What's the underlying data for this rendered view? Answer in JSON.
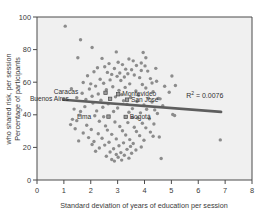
{
  "chart_data": {
    "type": "scatter",
    "title": "",
    "xlabel": "Standard deviation of years of education per session",
    "ylabel": "Percentage of participants who shared risk, per session",
    "xlim": [
      0,
      8
    ],
    "ylim": [
      0,
      100
    ],
    "xticks": [
      0,
      1,
      2,
      3,
      4,
      5,
      6,
      7,
      8
    ],
    "yticks": [
      0,
      20,
      40,
      60,
      80,
      100
    ],
    "grid": false,
    "legend": false,
    "annotations": [
      {
        "name": "r-squared",
        "text": "R2 = 0.0076",
        "prefix": "R",
        "sup": "2",
        "suffix": " = 0.0076",
        "x": 5.55,
        "y": 50.5
      }
    ],
    "trendline": {
      "name": "linear-fit",
      "color": "#5e5e5e",
      "x0": 0.98,
      "y0": 49.2,
      "x1": 6.85,
      "y1": 41.8,
      "width": 2.6
    },
    "marker": {
      "color": "#8c8c8c",
      "size": 1.7,
      "shape": "dot"
    },
    "highlight_marker": {
      "color": "#9a9a9a",
      "size": 3.4,
      "shape": "square",
      "edge": "#4a4a4a"
    },
    "labeled_points": [
      {
        "label": "Caracas",
        "x": 2.55,
        "y": 53.5,
        "label_dx": -30,
        "label_dy": 1.5
      },
      {
        "label": "Buenos Aires",
        "x": 2.72,
        "y": 49.8,
        "label_dx": -44,
        "label_dy": 2.0
      },
      {
        "label": "Montevideo",
        "x": 3.02,
        "y": 52.6,
        "label_dx": 4,
        "label_dy": 2.0
      },
      {
        "label": "San José",
        "x": 3.35,
        "y": 49.3,
        "label_dx": 4,
        "label_dy": 2.2
      },
      {
        "label": "Lima",
        "x": 2.66,
        "y": 38.9,
        "label_dx": -20,
        "label_dy": 2.0
      },
      {
        "label": "Bogotá",
        "x": 3.3,
        "y": 38.7,
        "label_dx": 4,
        "label_dy": 2.4
      }
    ],
    "points": [
      [
        1.05,
        94.4
      ],
      [
        1.62,
        86.0
      ],
      [
        2.05,
        81.3
      ],
      [
        2.95,
        78.6
      ],
      [
        3.95,
        78.2
      ],
      [
        1.52,
        75.0
      ],
      [
        2.42,
        74.6
      ],
      [
        3.42,
        74.2
      ],
      [
        3.58,
        73.1
      ],
      [
        3.02,
        72.2
      ],
      [
        2.68,
        71.4
      ],
      [
        3.18,
        70.8
      ],
      [
        3.7,
        70.2
      ],
      [
        4.02,
        70.0
      ],
      [
        2.52,
        69.5
      ],
      [
        2.25,
        68.9
      ],
      [
        2.88,
        68.4
      ],
      [
        3.3,
        68.0
      ],
      [
        3.52,
        67.6
      ],
      [
        3.88,
        67.2
      ],
      [
        4.12,
        66.8
      ],
      [
        2.12,
        66.4
      ],
      [
        2.62,
        66.0
      ],
      [
        3.08,
        65.6
      ],
      [
        3.38,
        65.2
      ],
      [
        2.78,
        64.8
      ],
      [
        3.62,
        64.4
      ],
      [
        1.88,
        64.0
      ],
      [
        2.98,
        63.6
      ],
      [
        3.25,
        63.2
      ],
      [
        3.82,
        62.8
      ],
      [
        4.22,
        62.2
      ],
      [
        2.35,
        61.8
      ],
      [
        2.72,
        61.4
      ],
      [
        3.12,
        61.0
      ],
      [
        4.45,
        60.6
      ],
      [
        1.72,
        59.8
      ],
      [
        2.48,
        59.4
      ],
      [
        3.45,
        59.0
      ],
      [
        3.92,
        58.6
      ],
      [
        5.15,
        58.0
      ],
      [
        2.18,
        57.6
      ],
      [
        2.82,
        57.2
      ],
      [
        3.28,
        56.8
      ],
      [
        4.05,
        56.4
      ],
      [
        1.95,
        55.8
      ],
      [
        2.58,
        55.4
      ],
      [
        3.05,
        55.0
      ],
      [
        3.68,
        54.6
      ],
      [
        4.32,
        54.2
      ],
      [
        4.92,
        53.8
      ],
      [
        1.68,
        53.2
      ],
      [
        2.28,
        52.8
      ],
      [
        3.15,
        52.4
      ],
      [
        3.78,
        52.0
      ],
      [
        2.05,
        51.4
      ],
      [
        2.92,
        51.0
      ],
      [
        3.48,
        50.6
      ],
      [
        4.15,
        50.2
      ],
      [
        4.58,
        49.8
      ],
      [
        1.82,
        49.4
      ],
      [
        2.38,
        49.0
      ],
      [
        3.22,
        48.6
      ],
      [
        3.72,
        48.2
      ],
      [
        4.28,
        47.8
      ],
      [
        2.08,
        47.2
      ],
      [
        2.65,
        46.8
      ],
      [
        3.35,
        46.4
      ],
      [
        3.98,
        46.0
      ],
      [
        4.68,
        45.6
      ],
      [
        5.02,
        63.8
      ],
      [
        1.78,
        45.0
      ],
      [
        2.45,
        44.6
      ],
      [
        3.0,
        44.2
      ],
      [
        3.55,
        43.8
      ],
      [
        4.08,
        43.4
      ],
      [
        4.38,
        43.0
      ],
      [
        2.22,
        42.4
      ],
      [
        2.85,
        42.0
      ],
      [
        3.42,
        41.6
      ],
      [
        3.85,
        41.2
      ],
      [
        4.48,
        40.8
      ],
      [
        5.05,
        40.2
      ],
      [
        1.58,
        39.8
      ],
      [
        2.15,
        39.4
      ],
      [
        2.48,
        38.8
      ],
      [
        3.55,
        38.4
      ],
      [
        3.75,
        38.0
      ],
      [
        4.18,
        37.6
      ],
      [
        1.32,
        37.2
      ],
      [
        1.48,
        36.4
      ],
      [
        2.32,
        36.0
      ],
      [
        2.9,
        35.6
      ],
      [
        3.38,
        35.2
      ],
      [
        3.92,
        34.8
      ],
      [
        4.35,
        34.4
      ],
      [
        1.25,
        34.0
      ],
      [
        1.85,
        33.6
      ],
      [
        2.55,
        33.2
      ],
      [
        3.08,
        32.8
      ],
      [
        3.62,
        32.4
      ],
      [
        4.05,
        32.0
      ],
      [
        1.42,
        31.4
      ],
      [
        2.02,
        31.0
      ],
      [
        2.62,
        30.6
      ],
      [
        3.18,
        30.2
      ],
      [
        3.7,
        29.8
      ],
      [
        4.22,
        29.4
      ],
      [
        1.72,
        28.8
      ],
      [
        2.28,
        28.4
      ],
      [
        2.78,
        28.0
      ],
      [
        3.3,
        27.6
      ],
      [
        3.82,
        27.2
      ],
      [
        4.32,
        26.8
      ],
      [
        4.55,
        26.4
      ],
      [
        1.92,
        26.0
      ],
      [
        2.42,
        25.6
      ],
      [
        2.95,
        25.2
      ],
      [
        3.45,
        24.8
      ],
      [
        3.98,
        24.4
      ],
      [
        1.55,
        24.0
      ],
      [
        2.12,
        23.6
      ],
      [
        2.68,
        23.2
      ],
      [
        3.22,
        22.8
      ],
      [
        3.58,
        22.4
      ],
      [
        2.05,
        21.8
      ],
      [
        2.52,
        21.4
      ],
      [
        3.05,
        21.0
      ],
      [
        3.48,
        20.6
      ],
      [
        3.88,
        20.2
      ],
      [
        2.32,
        19.6
      ],
      [
        2.85,
        19.2
      ],
      [
        3.35,
        18.8
      ],
      [
        3.68,
        18.4
      ],
      [
        2.18,
        17.6
      ],
      [
        2.72,
        17.2
      ],
      [
        3.12,
        16.8
      ],
      [
        3.52,
        16.4
      ],
      [
        2.95,
        15.6
      ],
      [
        3.25,
        15.2
      ],
      [
        2.58,
        14.6
      ],
      [
        3.02,
        14.0
      ],
      [
        3.42,
        13.4
      ],
      [
        4.62,
        13.2
      ],
      [
        2.78,
        12.6
      ],
      [
        3.15,
        12.2
      ],
      [
        2.88,
        11.6
      ],
      [
        5.12,
        39.6
      ],
      [
        6.82,
        24.6
      ],
      [
        4.75,
        57.5
      ],
      [
        4.05,
        75.0
      ],
      [
        3.88,
        71.8
      ],
      [
        4.42,
        68.5
      ],
      [
        1.38,
        43.5
      ],
      [
        1.62,
        42.0
      ],
      [
        1.48,
        50.5
      ],
      [
        1.28,
        56.0
      ],
      [
        2.0,
        59.0
      ],
      [
        4.52,
        50.0
      ],
      [
        4.28,
        59.5
      ]
    ]
  },
  "panel": {
    "letter": ""
  }
}
